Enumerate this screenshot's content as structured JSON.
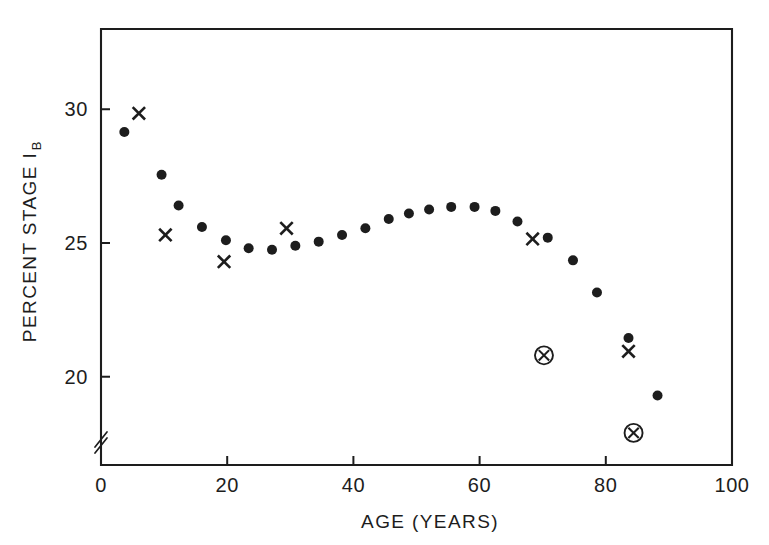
{
  "chart_data": {
    "type": "scatter",
    "title": "",
    "subtitle": "",
    "xlabel": "AGE (YEARS)",
    "ylabel": "PERCENT STAGE I",
    "ylabel_subscript": "B",
    "xlim": [
      0,
      100
    ],
    "ylim": [
      16.7,
      33.0
    ],
    "xticks": [
      0,
      20,
      40,
      60,
      80,
      100
    ],
    "xticklabels": [
      "0",
      "20",
      "40",
      "60",
      "80",
      "100"
    ],
    "yticks": [
      20,
      25,
      30
    ],
    "yticklabels": [
      "20",
      "25",
      "30"
    ],
    "grid": false,
    "legend": "none",
    "y_axis_break": true,
    "y_axis_break_note": "double-slash break mark on the y-axis just above the origin",
    "series": [
      {
        "name": "filled-circle",
        "marker": "filled-circle",
        "points": [
          {
            "x": 3.7,
            "y": 29.15
          },
          {
            "x": 9.6,
            "y": 27.55
          },
          {
            "x": 12.3,
            "y": 26.4
          },
          {
            "x": 16.0,
            "y": 25.6
          },
          {
            "x": 19.8,
            "y": 25.1
          },
          {
            "x": 23.4,
            "y": 24.8
          },
          {
            "x": 27.1,
            "y": 24.75
          },
          {
            "x": 30.8,
            "y": 24.9
          },
          {
            "x": 34.5,
            "y": 25.05
          },
          {
            "x": 38.2,
            "y": 25.3
          },
          {
            "x": 41.9,
            "y": 25.55
          },
          {
            "x": 45.6,
            "y": 25.9
          },
          {
            "x": 48.8,
            "y": 26.1
          },
          {
            "x": 52.0,
            "y": 26.25
          },
          {
            "x": 55.5,
            "y": 26.35
          },
          {
            "x": 59.2,
            "y": 26.35
          },
          {
            "x": 62.5,
            "y": 26.2
          },
          {
            "x": 66.0,
            "y": 25.8
          },
          {
            "x": 70.8,
            "y": 25.2
          },
          {
            "x": 74.8,
            "y": 24.35
          },
          {
            "x": 78.6,
            "y": 23.15
          },
          {
            "x": 83.6,
            "y": 21.45
          },
          {
            "x": 88.2,
            "y": 19.3
          }
        ]
      },
      {
        "name": "cross",
        "marker": "cross",
        "points": [
          {
            "x": 6.0,
            "y": 29.85
          },
          {
            "x": 10.2,
            "y": 25.3
          },
          {
            "x": 19.5,
            "y": 24.3
          },
          {
            "x": 29.4,
            "y": 25.55
          },
          {
            "x": 68.4,
            "y": 25.15
          },
          {
            "x": 83.6,
            "y": 20.95
          }
        ]
      },
      {
        "name": "circled-cross",
        "marker": "circled-cross",
        "points": [
          {
            "x": 70.2,
            "y": 20.8
          },
          {
            "x": 84.4,
            "y": 17.9
          }
        ]
      }
    ]
  },
  "colors": {
    "foreground": "#1d1d1d",
    "background": "#ffffff"
  }
}
